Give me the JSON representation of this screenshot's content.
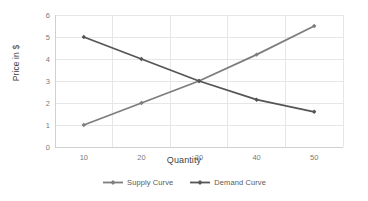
{
  "chart_data": {
    "type": "line",
    "title": "",
    "xlabel": "Quantity",
    "ylabel": "Price  in $",
    "xlim": [
      5,
      55
    ],
    "ylim": [
      0,
      6
    ],
    "x": [
      10,
      20,
      30,
      40,
      50
    ],
    "xticks": [
      "10",
      "20",
      "30",
      "40",
      "50"
    ],
    "yticks": [
      "0",
      "1",
      "2",
      "3",
      "4",
      "5",
      "6"
    ],
    "grid": "horizontal-and-vertical",
    "legend_position": "bottom-center",
    "marker": "diamond",
    "series": [
      {
        "name": "Supply Curve",
        "color": "#7d7d7d",
        "values": [
          1,
          2,
          3,
          4.2,
          5.5
        ]
      },
      {
        "name": "Demand Curve",
        "color": "#555555",
        "values": [
          5,
          4,
          3,
          2.15,
          1.6
        ]
      }
    ]
  },
  "axes": {
    "y_title": "Price  in $",
    "x_title": "Quantity",
    "y_tick_labels": [
      "6",
      "5",
      "4",
      "3",
      "2",
      "1",
      "0"
    ],
    "x_tick_labels": [
      "10",
      "20",
      "30",
      "40",
      "50"
    ]
  },
  "legend": {
    "items": [
      {
        "label": "Supply Curve"
      },
      {
        "label": "Demand Curve"
      }
    ]
  },
  "colors": {
    "supply": "#7d7d7d",
    "demand": "#555555",
    "grid": "#e6e6e6",
    "axis": "#d0d0d0",
    "text": "#5a5a5a"
  }
}
